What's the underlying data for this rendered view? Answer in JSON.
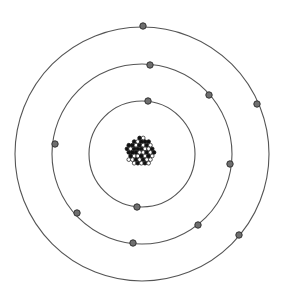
{
  "diagram": {
    "type": "atom-model",
    "background": "#ffffff",
    "center": {
      "x": 142,
      "y": 154
    },
    "nucleus": {
      "cx": 141,
      "cy": 152,
      "r": 16,
      "particle_rows": 8,
      "dark_color": "#111111",
      "light_color": "#ffffff"
    },
    "orbit_style": {
      "stroke": "#555555",
      "width": 1.1
    },
    "electron_style": {
      "r": 3.2,
      "fill": "#6f6f6f",
      "stroke": "#333333"
    },
    "shells": [
      {
        "name": "inner",
        "r": 53,
        "electrons": [
          [
            148,
            101
          ],
          [
            137,
            207
          ]
        ]
      },
      {
        "name": "middle",
        "r": 90,
        "electrons": [
          [
            150,
            65
          ],
          [
            209,
            95
          ],
          [
            55,
            144
          ],
          [
            230,
            164
          ],
          [
            77,
            213
          ],
          [
            198,
            225
          ],
          [
            133,
            243
          ]
        ]
      },
      {
        "name": "outer",
        "r": 127,
        "electrons": [
          [
            143,
            26
          ],
          [
            257,
            104
          ],
          [
            239,
            235
          ]
        ]
      }
    ]
  }
}
